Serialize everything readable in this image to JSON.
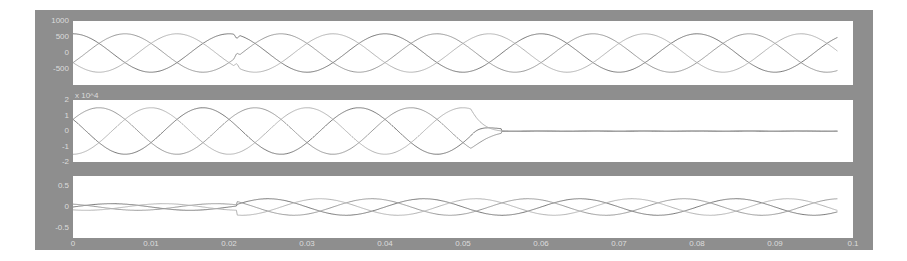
{
  "chart_data": [
    {
      "type": "line",
      "panel": 1,
      "title": "",
      "xlabel": "",
      "ylabel": "",
      "xlim": [
        0,
        0.1
      ],
      "ylim": [
        -1000,
        1000
      ],
      "yticks": [
        "1000",
        "500",
        "0",
        "-500"
      ],
      "grid": false,
      "description": "Three-phase 50 Hz voltage, amplitude ~600, small notch disturbance at t≈0.021 s",
      "series": [
        {
          "name": "phase A",
          "amplitude": 600,
          "freq_hz": 50,
          "phase_deg": 90,
          "t_end": 0.098
        },
        {
          "name": "phase B",
          "amplitude": 600,
          "freq_hz": 50,
          "phase_deg": -30,
          "t_end": 0.098
        },
        {
          "name": "phase C",
          "amplitude": 600,
          "freq_hz": 50,
          "phase_deg": 210,
          "t_end": 0.098
        }
      ],
      "annotations": [
        {
          "t": 0.021,
          "type": "notch"
        }
      ]
    },
    {
      "type": "line",
      "panel": 2,
      "title": "",
      "xlabel": "",
      "ylabel": "",
      "y_multiplier": "x 10^4",
      "xlim": [
        0,
        0.1
      ],
      "ylim": [
        -2,
        2
      ],
      "yticks": [
        "2",
        "1",
        "0",
        "-1",
        "-2"
      ],
      "grid": false,
      "description": "Three-phase 50 Hz signal, amplitude ~1.5e4, collapses to ~0 after t≈0.055 s",
      "series": [
        {
          "name": "phase A",
          "amplitude": 1.5,
          "freq_hz": 50,
          "phase_deg": 150,
          "collapse_t": 0.055,
          "t_end": 0.098
        },
        {
          "name": "phase B",
          "amplitude": 1.5,
          "freq_hz": 50,
          "phase_deg": 30,
          "collapse_t": 0.055,
          "t_end": 0.098
        },
        {
          "name": "phase C",
          "amplitude": 1.5,
          "freq_hz": 50,
          "phase_deg": 270,
          "collapse_t": 0.055,
          "t_end": 0.098
        }
      ]
    },
    {
      "type": "line",
      "panel": 3,
      "title": "",
      "xlabel": "",
      "ylabel": "",
      "xlim": [
        0,
        0.1
      ],
      "ylim": [
        -0.75,
        0.75
      ],
      "yticks": [
        "0.5",
        "0",
        "-0.5"
      ],
      "xticks": [
        "0",
        "0.01",
        "0.02",
        "0.03",
        "0.04",
        "0.05",
        "0.06",
        "0.07",
        "0.08",
        "0.09",
        "0.1"
      ],
      "grid": false,
      "description": "Three-phase 50 Hz current, amplitude ~0.08 before t≈0.021 s, ~0.2 afterwards",
      "series": [
        {
          "name": "phase A",
          "amp_before": 0.08,
          "amp_after": 0.2,
          "step_t": 0.021,
          "freq_hz": 50,
          "phase_deg": 0,
          "t_end": 0.098
        },
        {
          "name": "phase B",
          "amp_before": 0.08,
          "amp_after": 0.2,
          "step_t": 0.021,
          "freq_hz": 50,
          "phase_deg": 120,
          "t_end": 0.098
        },
        {
          "name": "phase C",
          "amp_before": 0.08,
          "amp_after": 0.2,
          "step_t": 0.021,
          "freq_hz": 50,
          "phase_deg": 240,
          "t_end": 0.098
        }
      ]
    }
  ],
  "colors": {
    "frame": "#8e8e8e",
    "plot_bg": "#ffffff",
    "tick_text": "#dcdcdc",
    "lines": [
      "#7a7a7a",
      "#9a9a9a",
      "#b4b4b4"
    ]
  }
}
